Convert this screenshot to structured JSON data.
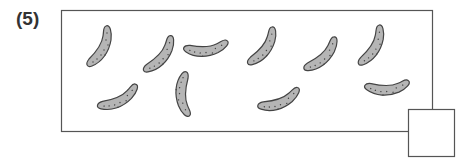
{
  "problem": {
    "number_label": "(5)",
    "item": "pickle",
    "item_count": 10,
    "answer_box_value": "",
    "pickles": [
      {
        "x": 100,
        "y": 46,
        "rot": 0
      },
      {
        "x": 160,
        "y": 54,
        "rot": 12
      },
      {
        "x": 207,
        "y": 47,
        "rot": 55
      },
      {
        "x": 263,
        "y": 46,
        "rot": 8
      },
      {
        "x": 322,
        "y": 54,
        "rot": 18
      },
      {
        "x": 372,
        "y": 45,
        "rot": 2
      },
      {
        "x": 119,
        "y": 97,
        "rot": 35
      },
      {
        "x": 185,
        "y": 95,
        "rot": 150
      },
      {
        "x": 280,
        "y": 99,
        "rot": 40
      },
      {
        "x": 388,
        "y": 86,
        "rot": 58
      }
    ],
    "colors": {
      "fill": "#b5b5b5",
      "stroke": "#444444",
      "border": "#555555"
    }
  }
}
